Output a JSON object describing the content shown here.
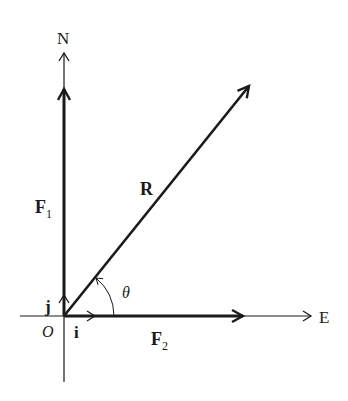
{
  "diagram": {
    "type": "vector-resolution",
    "colors": {
      "ink": "#1a1a1a",
      "background": "#ffffff"
    },
    "axes": {
      "north_label": "N",
      "east_label": "E",
      "origin_label": "O"
    },
    "vectors": {
      "F1": {
        "label": "F",
        "subscript": "1",
        "direction": "north"
      },
      "F2": {
        "label": "F",
        "subscript": "2",
        "direction": "east"
      },
      "R": {
        "label": "R",
        "direction": "north-east"
      }
    },
    "unit_vectors": {
      "i": "i",
      "j": "j"
    },
    "angle": {
      "label": "θ",
      "between": [
        "F2",
        "R"
      ]
    }
  }
}
